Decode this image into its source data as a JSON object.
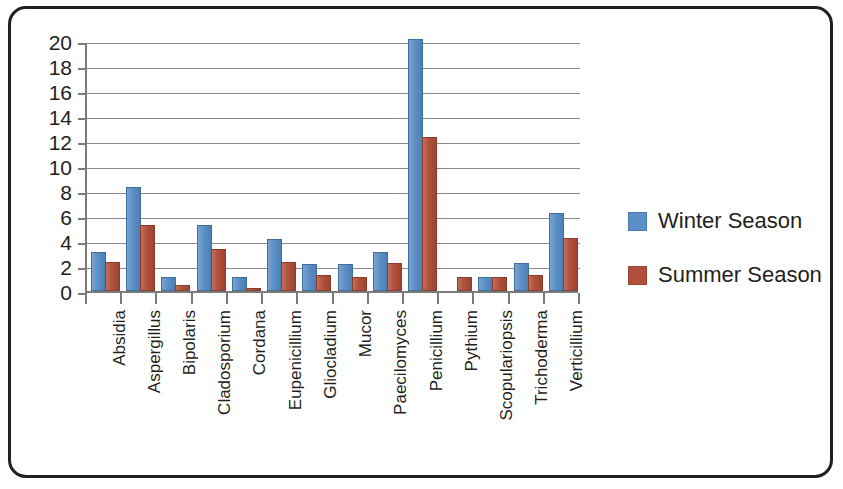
{
  "chart_data": {
    "type": "bar",
    "title": "",
    "xlabel": "",
    "ylabel": "",
    "ylim": [
      0,
      20
    ],
    "y_ticks": [
      0,
      2,
      4,
      6,
      8,
      10,
      12,
      14,
      16,
      18,
      20
    ],
    "grid": true,
    "legend_position": "right",
    "categories": [
      "Absidia",
      "Aspergillus",
      "Bipolaris",
      "Cladosporium",
      "Cordana",
      "Eupenicillium",
      "Gliocladium",
      "Mucor",
      "Paecilomyces",
      "Penicillium",
      "Pythium",
      "Scopulariopsis",
      "Trichoderma",
      "Verticillium"
    ],
    "series": [
      {
        "name": "Winter Season",
        "color": "#5B8FC7",
        "values": [
          3,
          8.2,
          1,
          5.1,
          1,
          4,
          2,
          2,
          3,
          20,
          0,
          1,
          2.1,
          6.1
        ]
      },
      {
        "name": "Summer Season",
        "color": "#B0503C",
        "values": [
          2.2,
          5.1,
          0.3,
          3.2,
          0.1,
          2.2,
          1.1,
          1,
          2.1,
          12.2,
          1,
          1,
          1.1,
          4.1
        ]
      }
    ]
  },
  "legend": {
    "items": [
      {
        "label": "Winter Season",
        "color": "#5B8FC7"
      },
      {
        "label": "Summer Season",
        "color": "#B0503C"
      }
    ]
  },
  "frame": {
    "border_color": "#231f20"
  }
}
